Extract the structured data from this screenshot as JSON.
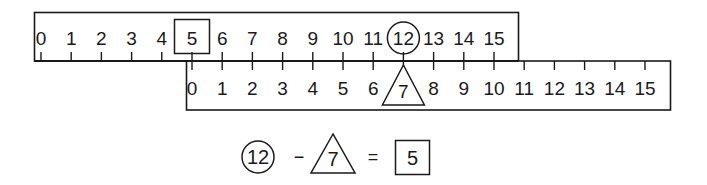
{
  "figure": {
    "top_ruler": {
      "labels": [
        "0",
        "1",
        "2",
        "3",
        "4",
        "5",
        "6",
        "7",
        "8",
        "9",
        "10",
        "11",
        "12",
        "13",
        "14",
        "15"
      ],
      "boxed_value": "5",
      "circled_value": "12"
    },
    "bottom_ruler": {
      "labels": [
        "0",
        "1",
        "2",
        "3",
        "4",
        "5",
        "6",
        "7",
        "8",
        "9",
        "10",
        "11",
        "12",
        "13",
        "14",
        "15"
      ],
      "triangled_value": "7",
      "offset_on_top_ruler": 5
    },
    "equation": {
      "minuend": "12",
      "minus": "−",
      "subtrahend": "7",
      "equals": "=",
      "result": "5"
    }
  },
  "colors": {
    "ink": "#1a1a1a",
    "background": "#ffffff"
  }
}
